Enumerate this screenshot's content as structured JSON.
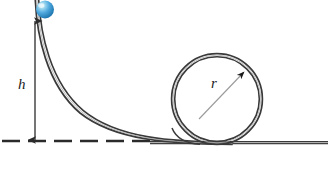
{
  "figure": {
    "background_color": "#ffffff"
  },
  "labels": {
    "height_label": "h",
    "radius_label": "r"
  },
  "colors": {
    "track": "#3a3a3a",
    "track_inner": "#8a8a8a",
    "ground_dash": "#2b2b2b",
    "arrow": "#2b2b2b",
    "radius_line": "#9a9a9a",
    "ball_highlight": "#c9eaf8",
    "ball_mid": "#49a6dd",
    "ball_edge": "#1f76b0",
    "label_text": "#1a1a1a"
  },
  "geometry": {
    "ball": {
      "cx": 45,
      "cy": 9.5,
      "r": 9
    },
    "loop": {
      "cx": 217,
      "cy": 99,
      "r": 45
    },
    "height_arrow": {
      "x": 35,
      "y_top": 20,
      "y_bottom": 141
    },
    "ground_line": {
      "y": 141,
      "x_start": 2,
      "x_end": 155
    },
    "ground_track": {
      "y": 143,
      "x_start": 175,
      "x_end": 328
    },
    "ramp_start": {
      "x": 36,
      "y": 0
    },
    "ramp_end": {
      "x": 230,
      "y": 144
    },
    "radius_arrow": {
      "x1": 200,
      "y1": 118,
      "x2": 244,
      "y2": 72
    }
  },
  "dash_pattern": "18 8"
}
